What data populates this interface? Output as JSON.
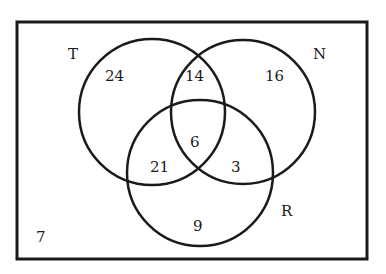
{
  "diagram": {
    "type": "venn",
    "universe_outside_count": "7",
    "sets": [
      {
        "name": "T",
        "label": "T"
      },
      {
        "name": "N",
        "label": "N"
      },
      {
        "name": "R",
        "label": "R"
      }
    ],
    "regions": {
      "T_only": "24",
      "N_only": "16",
      "R_only": "9",
      "T_and_N_only": "14",
      "T_and_R_only": "21",
      "N_and_R_only": "3",
      "T_N_R": "6",
      "none": "7"
    },
    "colors": {
      "stroke": "#1a1a1a",
      "background": "#ffffff"
    }
  }
}
